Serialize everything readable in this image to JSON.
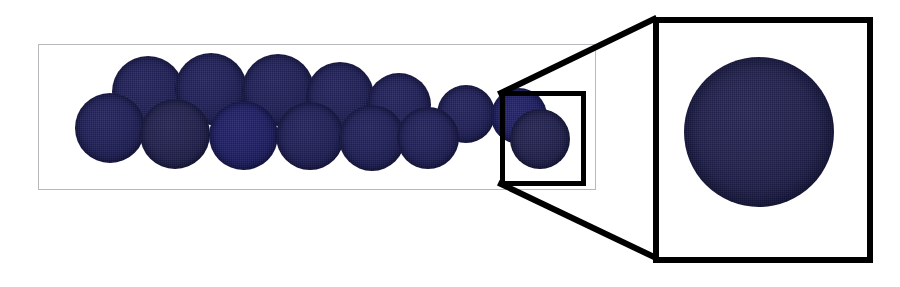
{
  "figure": {
    "caption": "",
    "width": 900,
    "height": 287,
    "background_color": "#ffffff"
  },
  "colors": {
    "particle_fill": "#2d2d68",
    "particle_highlight": "#33336e",
    "particle_rim": "#15153a",
    "overview_frame": "#b9b9bd",
    "roi_frame": "#000000",
    "inset_frame": "#000000",
    "callout_line": "#000000"
  },
  "overview_panel": {
    "name": "overview-panel",
    "label": "",
    "frame_style": "thin-grey",
    "frame_width_px": 1,
    "x": 38,
    "y": 44,
    "width": 558,
    "height": 146
  },
  "particles": {
    "count": 14,
    "rows": [
      "back",
      "front"
    ],
    "items": [
      {
        "id": "p01",
        "row": "front",
        "cx": 110,
        "cy": 128,
        "d": 70
      },
      {
        "id": "p02",
        "row": "back",
        "cx": 148,
        "cy": 92,
        "d": 72
      },
      {
        "id": "p03",
        "row": "front",
        "cx": 175,
        "cy": 134,
        "d": 70
      },
      {
        "id": "p04",
        "row": "back",
        "cx": 211,
        "cy": 89,
        "d": 72
      },
      {
        "id": "p05",
        "row": "front",
        "cx": 243,
        "cy": 135,
        "d": 69
      },
      {
        "id": "p06",
        "row": "back",
        "cx": 278,
        "cy": 90,
        "d": 72
      },
      {
        "id": "p07",
        "row": "front",
        "cx": 310,
        "cy": 136,
        "d": 68
      },
      {
        "id": "p08",
        "row": "back",
        "cx": 340,
        "cy": 96,
        "d": 68
      },
      {
        "id": "p09",
        "row": "front",
        "cx": 372,
        "cy": 138,
        "d": 66
      },
      {
        "id": "p10",
        "row": "back",
        "cx": 399,
        "cy": 105,
        "d": 64
      },
      {
        "id": "p11",
        "row": "front",
        "cx": 428,
        "cy": 138,
        "d": 62
      },
      {
        "id": "p12",
        "row": "back",
        "cx": 466,
        "cy": 114,
        "d": 58
      },
      {
        "id": "p13",
        "row": "back",
        "cx": 519,
        "cy": 116,
        "d": 56
      },
      {
        "id": "p14",
        "row": "front",
        "cx": 540,
        "cy": 139,
        "d": 60
      }
    ]
  },
  "roi_box": {
    "name": "roi-selection-box",
    "label": "",
    "x": 500,
    "y": 91,
    "width": 86,
    "height": 95,
    "border_px": 5
  },
  "callout": {
    "name": "magnification-callout",
    "line_width_px": 6,
    "upper_line": {
      "x1": 501,
      "y1": 93,
      "x2": 654,
      "y2": 19
    },
    "lower_line": {
      "x1": 501,
      "y1": 184,
      "x2": 654,
      "y2": 257
    }
  },
  "inset_panel": {
    "name": "magnified-inset-panel",
    "label": "",
    "frame_style": "thick-black",
    "frame_width_px": 6,
    "x": 653,
    "y": 17,
    "width": 220,
    "height": 246,
    "particle": {
      "id": "p-magnified",
      "cx": 759,
      "cy": 132,
      "d": 150
    }
  }
}
